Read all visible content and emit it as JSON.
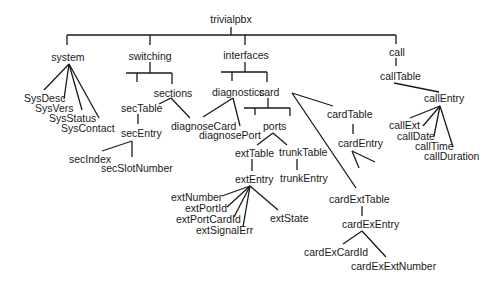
{
  "diagram": {
    "root": {
      "id": "trivialpbx",
      "label": "trivialpbx",
      "x": 231,
      "y": 19
    },
    "nodes": [
      {
        "id": "system",
        "label": "system",
        "x": 68,
        "y": 57
      },
      {
        "id": "switching",
        "label": "switching",
        "x": 150,
        "y": 56
      },
      {
        "id": "interfaces",
        "label": "interfaces",
        "x": 246,
        "y": 55
      },
      {
        "id": "call",
        "label": "call",
        "x": 397,
        "y": 52
      },
      {
        "id": "SysDesc",
        "label": "SysDesc",
        "x": 37,
        "y": 98
      },
      {
        "id": "SysVers",
        "label": "SysVers",
        "x": 46,
        "y": 108
      },
      {
        "id": "SysStatus",
        "label": "SysStatus",
        "x": 65,
        "y": 118
      },
      {
        "id": "SysContact",
        "label": "SysContact",
        "x": 82,
        "y": 128
      },
      {
        "id": "sections",
        "label": "sections",
        "x": 173,
        "y": 93
      },
      {
        "id": "secTable",
        "label": "secTable",
        "x": 134,
        "y": 108
      },
      {
        "id": "secEntry",
        "label": "secEntry",
        "x": 138,
        "y": 143
      },
      {
        "id": "secIndex",
        "label": "secIndex",
        "x": 86,
        "y": 159
      },
      {
        "id": "secSlotNumber",
        "label": "secSlotNumber",
        "x": 131,
        "y": 168
      },
      {
        "id": "diagnoseCard",
        "label": "diagnoseCard",
        "x": 199,
        "y": 126
      },
      {
        "id": "diagnostics",
        "label": "diagnostics",
        "x": 238,
        "y": 92
      },
      {
        "id": "card",
        "label": "card",
        "x": 268,
        "y": 92
      },
      {
        "id": "diagnosePort",
        "label": "diagnosePort",
        "x": 256,
        "y": 136
      },
      {
        "id": "ports",
        "label": "ports",
        "x": 274,
        "y": 126
      },
      {
        "id": "extTable",
        "label": "extTable",
        "x": 257,
        "y": 153
      },
      {
        "id": "trunkTable",
        "label": "trunkTable",
        "x": 299,
        "y": 152
      },
      {
        "id": "extEntry",
        "label": "extEntry",
        "x": 256,
        "y": 179
      },
      {
        "id": "trunkEntry",
        "label": "trunkEntry",
        "x": 299,
        "y": 178
      },
      {
        "id": "extNumber",
        "label": "extNumber",
        "x": 195,
        "y": 197
      },
      {
        "id": "extPortId",
        "label": "extPortId",
        "x": 210,
        "y": 208
      },
      {
        "id": "extPortCardId",
        "label": "extPortCardId",
        "x": 205,
        "y": 219
      },
      {
        "id": "extSignalErr",
        "label": "extSignalErr",
        "x": 219,
        "y": 230
      },
      {
        "id": "extState",
        "label": "extState",
        "x": 286,
        "y": 218
      },
      {
        "id": "cardTable",
        "label": "cardTable",
        "x": 350,
        "y": 117
      },
      {
        "id": "cardEntry",
        "label": "cardEntry",
        "x": 355,
        "y": 143
      },
      {
        "id": "cardExtTable",
        "label": "cardExtTable",
        "x": 360,
        "y": 199
      },
      {
        "id": "cardExEntry",
        "label": "cardExEntry",
        "x": 366,
        "y": 224
      },
      {
        "id": "cardExCardId",
        "label": "cardExCardId",
        "x": 317,
        "y": 252
      },
      {
        "id": "cardExExtNumber",
        "label": "cardExExtNumber",
        "x": 363,
        "y": 267
      },
      {
        "id": "callTable",
        "label": "callTable",
        "x": 396,
        "y": 79
      },
      {
        "id": "callEntry",
        "label": "callEntry",
        "x": 436,
        "y": 102
      },
      {
        "id": "callExt",
        "label": "callExt",
        "x": 407,
        "y": 129
      },
      {
        "id": "callDate",
        "label": "callDate",
        "x": 414,
        "y": 139
      },
      {
        "id": "callTime",
        "label": "callTime",
        "x": 427,
        "y": 150
      },
      {
        "id": "callDuration",
        "label": "callDuration",
        "x": 443,
        "y": 160
      }
    ],
    "labels": {
      "trivialpbx": "trivialpbx",
      "system": "system",
      "switching": "switching",
      "interfaces": "interfaces",
      "call": "call",
      "SysDesc": "SysDesc",
      "SysVers": "SysVers",
      "SysStatus": "SysStatus",
      "SysContact": "SysContact",
      "sections": "sections",
      "secTable": "secTable",
      "secEntry": "secEntry",
      "secIndex": "secIndex",
      "secSlotNumber": "secSlotNumber",
      "diagnoseCard": "diagnoseCard",
      "diagnostics": "diagnostics",
      "card": "card",
      "diagnosePort": "diagnosePort",
      "ports": "ports",
      "extTable": "extTable",
      "trunkTable": "trunkTable",
      "extEntry": "extEntry",
      "trunkEntry": "trunkEntry",
      "extNumber": "extNumber",
      "extPortId": "extPortId",
      "extPortCardId": "extPortCardId",
      "extSignalErr": "extSignalErr",
      "extState": "extState",
      "cardTable": "cardTable",
      "cardEntry": "cardEntry",
      "cardExtTable": "cardExtTable",
      "cardExEntry": "cardExEntry",
      "cardExCardId": "cardExCardId",
      "cardExExtNumber": "cardExExtNumber",
      "callTable": "callTable",
      "callEntry": "callEntry",
      "callExt": "callExt",
      "callDate": "callDate",
      "callTime": "callTime",
      "callDuration": "callDuration"
    },
    "edges": [
      [
        "trivialpbx",
        "system"
      ],
      [
        "trivialpbx",
        "switching"
      ],
      [
        "trivialpbx",
        "interfaces"
      ],
      [
        "trivialpbx",
        "call"
      ],
      [
        "system",
        "SysDesc"
      ],
      [
        "system",
        "SysVers"
      ],
      [
        "system",
        "SysStatus"
      ],
      [
        "system",
        "SysContact"
      ],
      [
        "switching",
        "secTable-branch"
      ],
      [
        "switching",
        "sections"
      ],
      [
        "sections",
        "secTable"
      ],
      [
        "sections",
        "diagnoseCard"
      ],
      [
        "secTable",
        "secEntry"
      ],
      [
        "secEntry",
        "secIndex"
      ],
      [
        "secEntry",
        "secSlotNumber"
      ],
      [
        "interfaces",
        "diagnostics"
      ],
      [
        "interfaces",
        "card"
      ],
      [
        "diagnostics",
        "diagnoseCard"
      ],
      [
        "diagnostics",
        "diagnosePort"
      ],
      [
        "card",
        "ports"
      ],
      [
        "card",
        "cardTable"
      ],
      [
        "card",
        "cardExtTable"
      ],
      [
        "ports",
        "extTable"
      ],
      [
        "ports",
        "trunkTable"
      ],
      [
        "extTable",
        "extEntry"
      ],
      [
        "trunkTable",
        "trunkEntry"
      ],
      [
        "extEntry",
        "extNumber"
      ],
      [
        "extEntry",
        "extPortId"
      ],
      [
        "extEntry",
        "extPortCardId"
      ],
      [
        "extEntry",
        "extSignalErr"
      ],
      [
        "extEntry",
        "extState"
      ],
      [
        "cardTable",
        "cardEntry"
      ],
      [
        "cardExtTable",
        "cardExEntry"
      ],
      [
        "cardExEntry",
        "cardExCardId"
      ],
      [
        "cardExEntry",
        "cardExExtNumber"
      ],
      [
        "call",
        "callTable"
      ],
      [
        "callTable",
        "callEntry"
      ],
      [
        "callEntry",
        "callExt"
      ],
      [
        "callEntry",
        "callDate"
      ],
      [
        "callEntry",
        "callTime"
      ],
      [
        "callEntry",
        "callDuration"
      ]
    ]
  }
}
